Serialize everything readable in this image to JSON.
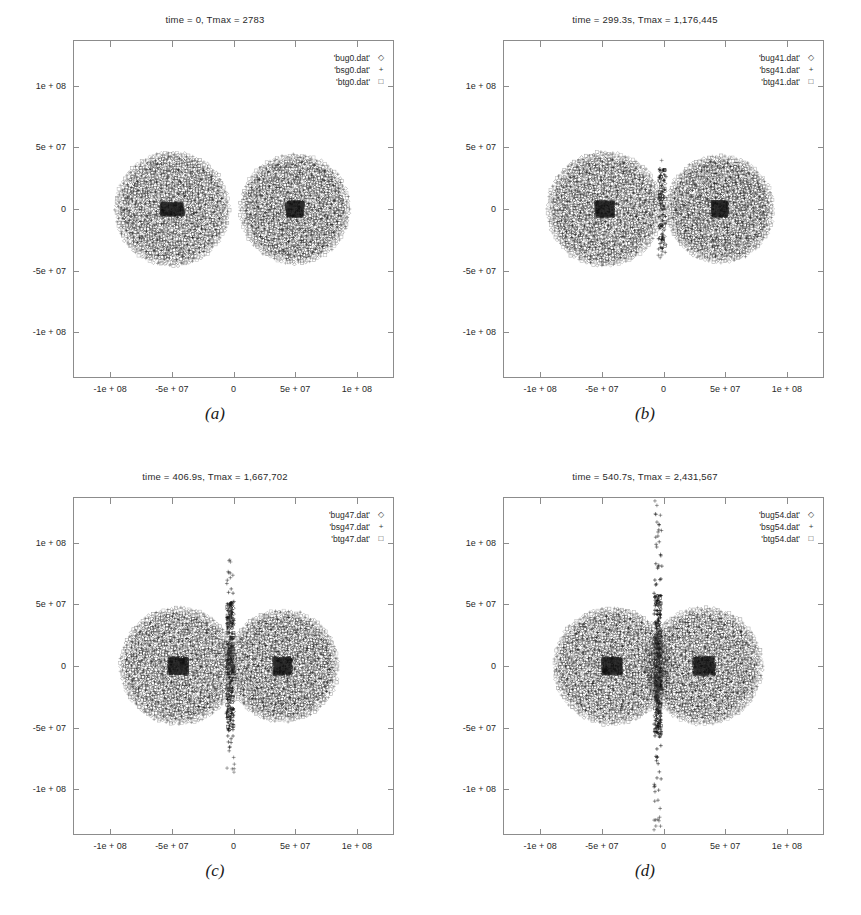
{
  "figure": {
    "background": "#ffffff",
    "ink": "#1a1a1a",
    "frame_color": "#8c8c8c"
  },
  "chart_data": {
    "type": "scatter",
    "xlabel": "",
    "ylabel": "",
    "xlim": [
      -130000000,
      130000000
    ],
    "ylim": [
      -137000000,
      137000000
    ],
    "xticks": [
      -100000000,
      -50000000,
      0,
      50000000,
      100000000
    ],
    "xticklabels": [
      "-1e + 08",
      "-5e + 07",
      "0",
      "5e + 07",
      "1e + 08"
    ],
    "yticks": [
      100000000,
      50000000,
      0,
      -50000000,
      -100000000
    ],
    "yticklabels": [
      "1e + 08",
      "5e + 07",
      "0",
      "-5e + 07",
      "-1e + 08"
    ],
    "grid": false,
    "legend_position": "top-right",
    "panels": [
      {
        "key": "a",
        "caption": "(a)",
        "title": "time = 0, Tmax  =  2783",
        "time_s": 0,
        "tmax": 2783,
        "legend": [
          {
            "label": "'bug0.dat'",
            "symbol": "◇"
          },
          {
            "label": "'bsg0.dat'",
            "symbol": "+"
          },
          {
            "label": "'btg0.dat'",
            "symbol": "□"
          }
        ],
        "bodies": [
          {
            "name": "left-body",
            "cx": -50000000,
            "cy": 0,
            "radius": 46000000,
            "core_rx": 9000000,
            "core_ry": 5000000
          },
          {
            "name": "right-body",
            "cx": 50000000,
            "cy": 0,
            "radius": 44000000,
            "core_rx": 6500000,
            "core_ry": 6000000
          }
        ],
        "contact": {
          "present": false,
          "intensity": 0.0,
          "spike": 0.0
        }
      },
      {
        "key": "b",
        "caption": "(b)",
        "title": "time = 299.3s, Tmax  =  1,176,445",
        "time_s": 299.3,
        "tmax": 1176445,
        "legend": [
          {
            "label": "'bug41.dat'",
            "symbol": "◇"
          },
          {
            "label": "'bsg41.dat'",
            "symbol": "+"
          },
          {
            "label": "'btg41.dat'",
            "symbol": "□"
          }
        ],
        "bodies": [
          {
            "name": "left-body",
            "cx": -48000000,
            "cy": 0,
            "radius": 46000000,
            "core_rx": 7000000,
            "core_ry": 6000000
          },
          {
            "name": "right-body",
            "cx": 46000000,
            "cy": 0,
            "radius": 43000000,
            "core_rx": 6000000,
            "core_ry": 6000000
          }
        ],
        "contact": {
          "present": true,
          "intensity": 0.35,
          "spike": 0.15
        }
      },
      {
        "key": "c",
        "caption": "(c)",
        "title": "time = 406.9s, Tmax  =  1,667,702",
        "time_s": 406.9,
        "tmax": 1667702,
        "legend": [
          {
            "label": "'bug47.dat'",
            "symbol": "◇"
          },
          {
            "label": "'bsg47.dat'",
            "symbol": "+"
          },
          {
            "label": "'btg47.dat'",
            "symbol": "□"
          }
        ],
        "bodies": [
          {
            "name": "left-body",
            "cx": -45000000,
            "cy": 0,
            "radius": 47000000,
            "core_rx": 7500000,
            "core_ry": 6500000
          },
          {
            "name": "right-body",
            "cx": 40000000,
            "cy": 0,
            "radius": 45000000,
            "core_rx": 7000000,
            "core_ry": 6500000
          }
        ],
        "contact": {
          "present": true,
          "intensity": 0.85,
          "spike": 0.45
        }
      },
      {
        "key": "d",
        "caption": "(d)",
        "title": "time = 540.7s, Tmax  =  2,431,567",
        "time_s": 540.7,
        "tmax": 2431567,
        "legend": [
          {
            "label": "'bug54.dat'",
            "symbol": "◇"
          },
          {
            "label": "'bsg54.dat'",
            "symbol": "+"
          },
          {
            "label": "'btg54.dat'",
            "symbol": "□"
          }
        ],
        "bodies": [
          {
            "name": "left-body",
            "cx": -42000000,
            "cy": 0,
            "radius": 47000000,
            "core_rx": 7500000,
            "core_ry": 6500000
          },
          {
            "name": "right-body",
            "cx": 33000000,
            "cy": 0,
            "radius": 47000000,
            "core_rx": 8500000,
            "core_ry": 7000000
          }
        ],
        "contact": {
          "present": true,
          "intensity": 1.0,
          "spike": 1.0
        }
      }
    ]
  }
}
